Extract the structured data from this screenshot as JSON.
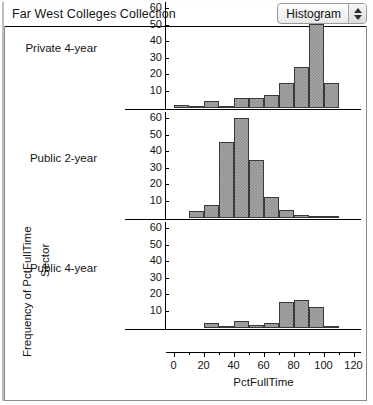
{
  "window": {
    "title": "Far West Colleges Collection"
  },
  "platform_menu": {
    "label": "Histogram",
    "stepper_up": "up-arrow",
    "stepper_down": "down-arrow"
  },
  "axes": {
    "y_group_label": "Frequency of PctFullTime",
    "y_inner_label": "Sector",
    "x_label": "PctFullTime"
  },
  "chart_data": {
    "type": "bar",
    "title": "Far West Colleges Collection",
    "subtitle": "Histogram of PctFullTime by Sector",
    "xlabel": "PctFullTime",
    "ylabel": "Frequency of PctFullTime",
    "group_label": "Sector",
    "grid": false,
    "legend": "none",
    "xlim": [
      -5,
      125
    ],
    "xticks": [
      0,
      20,
      40,
      60,
      80,
      100,
      120
    ],
    "xminor_ticks": [
      10,
      30,
      50,
      70,
      90,
      110
    ],
    "ylim": [
      0,
      65
    ],
    "yticks": [
      10,
      20,
      30,
      40,
      50,
      60
    ],
    "bin_width": 10,
    "panels": [
      {
        "name": "Private 4-year",
        "bin_starts": [
          0,
          10,
          20,
          30,
          40,
          50,
          60,
          70,
          80,
          90,
          100
        ],
        "values": [
          2,
          1,
          4,
          1,
          6,
          6,
          8,
          15,
          25,
          51,
          15
        ]
      },
      {
        "name": "Public 2-year",
        "bin_starts": [
          10,
          20,
          30,
          40,
          50,
          60,
          70,
          80,
          90,
          100
        ],
        "values": [
          4,
          8,
          46,
          61,
          35,
          13,
          5,
          2,
          1,
          1
        ]
      },
      {
        "name": "Public 4-year",
        "bin_starts": [
          20,
          30,
          40,
          50,
          60,
          70,
          80,
          90,
          100
        ],
        "values": [
          3,
          1,
          4,
          2,
          3,
          16,
          17,
          13,
          1
        ]
      }
    ]
  }
}
